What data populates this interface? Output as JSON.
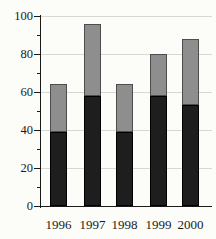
{
  "chart_data": {
    "type": "bar",
    "stacked": true,
    "title": "",
    "xlabel": "",
    "ylabel": "",
    "categories": [
      "1996",
      "1997",
      "1998",
      "1999",
      "2000"
    ],
    "series": [
      {
        "name": "solid-dark-segment",
        "color": "#1e1e1e",
        "border_color": "#000000",
        "values": [
          39,
          58,
          39,
          58,
          53
        ]
      },
      {
        "name": "shaded-gray-segment",
        "color": "#8e8e8e",
        "border_color": "#4d4d4d",
        "values": [
          25,
          38,
          25,
          22,
          35
        ]
      }
    ],
    "totals": [
      64,
      96,
      64,
      80,
      88
    ],
    "ylim": [
      0,
      100
    ],
    "y_major_ticks": [
      0,
      20,
      40,
      60,
      80,
      100
    ],
    "y_minor_ticks": [
      10,
      30,
      50,
      70,
      90
    ],
    "grid": "horizontal-major-lines",
    "legend": "none",
    "axis_color": "#1a1a1a",
    "gridline_color": "#d7d7d4",
    "background_color": "#fcfcf9"
  }
}
